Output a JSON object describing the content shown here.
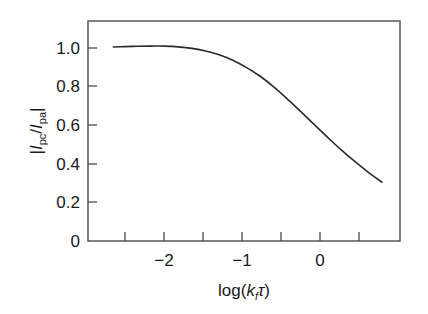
{
  "chart_data": {
    "type": "line",
    "title": "",
    "subtitle": "",
    "xlabel": "log(kƒτ)",
    "xlabel_parts": {
      "func": "log(",
      "symbol": "k",
      "subscript": "f",
      "tau": "τ",
      "close": ")"
    },
    "ylabel": "|I pc / I pa|",
    "ylabel_parts": {
      "bar_open": "|",
      "num_symbol": "I",
      "num_subscript": "pc",
      "slash": "/",
      "den_symbol": "I",
      "den_subscript": "pa",
      "bar_close": "|"
    },
    "xlim": [
      -2.65,
      0.8
    ],
    "ylim": [
      0,
      1.14
    ],
    "xticks": [
      -2.5,
      -2.0,
      -1.5,
      -1.0,
      -0.5,
      0.0,
      0.5
    ],
    "xtick_labels": [
      "",
      "−2",
      "",
      "−1",
      "",
      "0",
      ""
    ],
    "yticks": [
      0,
      0.2,
      0.4,
      0.6,
      0.8,
      1.0
    ],
    "ytick_labels": [
      "0",
      "0.2",
      "0.4",
      "0.6",
      "0.8",
      "1.0"
    ],
    "grid": false,
    "legend": null,
    "legend_position": "none",
    "series": [
      {
        "name": "|Ipc/Ipa| vs log(kfτ)",
        "x": [
          -2.37,
          -2.25,
          -2.1,
          -1.95,
          -1.8,
          -1.65,
          -1.5,
          -1.35,
          -1.2,
          -1.05,
          -0.9,
          -0.75,
          -0.6,
          -0.45,
          -0.3,
          -0.15,
          0.0,
          0.15,
          0.3,
          0.45,
          0.6
        ],
        "y": [
          1.005,
          1.007,
          1.009,
          1.01,
          1.01,
          1.006,
          0.998,
          0.985,
          0.965,
          0.937,
          0.9,
          0.855,
          0.8,
          0.738,
          0.672,
          0.604,
          0.537,
          0.472,
          0.412,
          0.356,
          0.305
        ]
      }
    ],
    "colors": {
      "curve": "#2b2b2b",
      "axis": "#4a4a4a",
      "text": "#1a1a1a",
      "background": "#ffffff"
    }
  },
  "axes": {
    "x_tick_label_minus2": "−2",
    "x_tick_label_minus1": "−1",
    "x_tick_label_zero": "0",
    "y_tick_label_0": "0",
    "y_tick_label_02": "0.2",
    "y_tick_label_04": "0.4",
    "y_tick_label_06": "0.6",
    "y_tick_label_08": "0.8",
    "y_tick_label_10": "1.0"
  },
  "labels": {
    "x_func": "log(",
    "x_k": "k",
    "x_k_sub": "f",
    "x_tau": "τ",
    "x_close": ")",
    "y_bar_open": "|",
    "y_I1": "I",
    "y_sub1": "pc",
    "y_slash": "/",
    "y_I2": "I",
    "y_sub2": "pa",
    "y_bar_close": "|"
  }
}
